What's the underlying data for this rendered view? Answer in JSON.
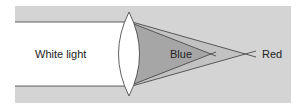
{
  "diagram": {
    "labels": {
      "white_light": "White light",
      "blue": "Blue",
      "red": "Red"
    },
    "colors": {
      "background_panel": "#d4d4d4",
      "beam": "#ffffff",
      "blue_cone": "#a8a8a8",
      "red_cone": "#c2c2c2",
      "lines": "#3a3a3a"
    }
  }
}
